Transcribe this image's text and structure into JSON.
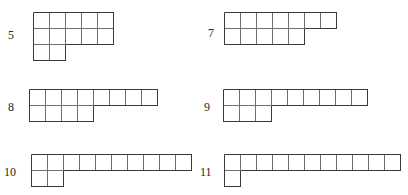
{
  "page": {
    "background_color": "#ffffff",
    "stroke_color_outer": "#3a3a3a",
    "stroke_color_inner": "#6f6f6f",
    "cell_size_px": 16,
    "figure_count": 6
  },
  "chart_data": {
    "type": "diagram",
    "title": "",
    "unit": "cell",
    "figures": [
      {
        "label": "5",
        "row_index": 0,
        "column_index": 0,
        "row_widths": [
          5,
          5,
          2
        ],
        "total_cells": 12
      },
      {
        "label": "7",
        "row_index": 0,
        "column_index": 1,
        "row_widths": [
          7,
          5
        ],
        "total_cells": 12
      },
      {
        "label": "8",
        "row_index": 1,
        "column_index": 0,
        "row_widths": [
          8,
          4
        ],
        "total_cells": 12
      },
      {
        "label": "9",
        "row_index": 1,
        "column_index": 1,
        "row_widths": [
          9,
          3
        ],
        "total_cells": 12
      },
      {
        "label": "10",
        "row_index": 2,
        "column_index": 0,
        "row_widths": [
          10,
          2
        ],
        "total_cells": 12
      },
      {
        "label": "11",
        "row_index": 2,
        "column_index": 1,
        "row_widths": [
          11,
          1
        ],
        "total_cells": 12
      }
    ],
    "layout": {
      "columns": 2,
      "rows": 3,
      "label_position": "left",
      "grid": false,
      "legend": false
    }
  },
  "positions": [
    {
      "label": "5",
      "label_x": 8,
      "label_y": 29,
      "grid_x": 33,
      "grid_y": 12
    },
    {
      "label": "7",
      "label_x": 208,
      "label_y": 27,
      "grid_x": 224,
      "grid_y": 12
    },
    {
      "label": "8",
      "label_x": 8,
      "label_y": 101,
      "grid_x": 29,
      "grid_y": 89
    },
    {
      "label": "9",
      "label_x": 204,
      "label_y": 101,
      "grid_x": 223,
      "grid_y": 89
    },
    {
      "label": "10",
      "label_x": 4,
      "label_y": 166,
      "grid_x": 31,
      "grid_y": 154
    },
    {
      "label": "11",
      "label_x": 200,
      "label_y": 166,
      "grid_x": 224,
      "grid_y": 154
    }
  ]
}
